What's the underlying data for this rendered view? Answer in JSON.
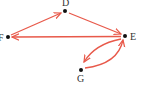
{
  "graph": {
    "type": "directed",
    "edge_color": "#e8594a",
    "node_color": "#111111",
    "nodes": [
      {
        "id": "D",
        "label": "D",
        "x": 65,
        "y": 11
      },
      {
        "id": "E",
        "label": "E",
        "x": 125,
        "y": 36
      },
      {
        "id": "F",
        "label": "F",
        "x": 8,
        "y": 37
      },
      {
        "id": "G",
        "label": "G",
        "x": 81,
        "y": 70
      }
    ],
    "edges": [
      {
        "from": "F",
        "to": "D"
      },
      {
        "from": "D",
        "to": "E"
      },
      {
        "from": "E",
        "to": "F"
      },
      {
        "from": "E",
        "to": "G"
      },
      {
        "from": "G",
        "to": "E"
      }
    ]
  }
}
